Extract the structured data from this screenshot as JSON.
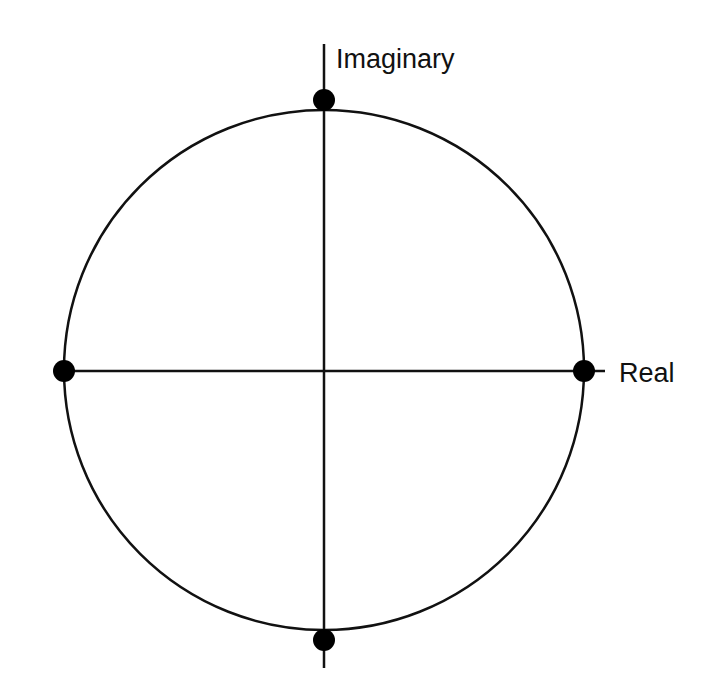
{
  "diagram": {
    "type": "unit-circle-complex-plane",
    "axes": {
      "horizontal_label": "Real",
      "vertical_label": "Imaginary"
    },
    "points": [
      {
        "name": "top",
        "position": "positive-imaginary"
      },
      {
        "name": "right",
        "position": "positive-real"
      },
      {
        "name": "bottom",
        "position": "negative-imaginary"
      },
      {
        "name": "left",
        "position": "negative-real"
      }
    ],
    "colors": {
      "stroke": "#111111",
      "point": "#000000",
      "background": "#ffffff"
    }
  }
}
